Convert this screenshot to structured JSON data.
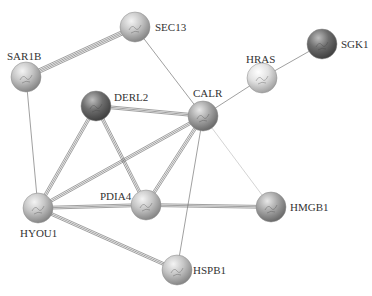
{
  "diagram": {
    "type": "protein-interaction-network",
    "node_radius": 15,
    "nodes": [
      {
        "id": "SEC13",
        "label": "SEC13",
        "x": 135,
        "y": 27,
        "shade": "light",
        "label_x": 155,
        "label_y": 31,
        "label_anchor": "start"
      },
      {
        "id": "SAR1B",
        "label": "SAR1B",
        "x": 26,
        "y": 77,
        "shade": "light",
        "label_x": 7,
        "label_y": 60,
        "label_anchor": "start"
      },
      {
        "id": "DERL2",
        "label": "DERL2",
        "x": 96,
        "y": 106,
        "shade": "dark",
        "label_x": 114,
        "label_y": 101,
        "label_anchor": "start"
      },
      {
        "id": "CALR",
        "label": "CALR",
        "x": 203,
        "y": 116,
        "shade": "mid",
        "label_x": 193,
        "label_y": 97,
        "label_anchor": "start"
      },
      {
        "id": "HRAS",
        "label": "HRAS",
        "x": 262,
        "y": 78,
        "shade": "lighter",
        "label_x": 246,
        "label_y": 63,
        "label_anchor": "start"
      },
      {
        "id": "SGK1",
        "label": "SGK1",
        "x": 322,
        "y": 44,
        "shade": "dark",
        "label_x": 341,
        "label_y": 48,
        "label_anchor": "start"
      },
      {
        "id": "PDIA4",
        "label": "PDIA4",
        "x": 146,
        "y": 205,
        "shade": "light",
        "label_x": 100,
        "label_y": 200,
        "label_anchor": "start"
      },
      {
        "id": "HMGB1",
        "label": "HMGB1",
        "x": 271,
        "y": 207,
        "shade": "mid",
        "label_x": 290,
        "label_y": 211,
        "label_anchor": "start"
      },
      {
        "id": "HYOU1",
        "label": "HYOU1",
        "x": 38,
        "y": 208,
        "shade": "light",
        "label_x": 20,
        "label_y": 237,
        "label_anchor": "start"
      },
      {
        "id": "HSPB1",
        "label": "HSPB1",
        "x": 177,
        "y": 270,
        "shade": "light",
        "label_x": 193,
        "label_y": 274,
        "label_anchor": "start"
      }
    ],
    "edges": [
      {
        "source": "SAR1B",
        "target": "SEC13",
        "strength": "strong"
      },
      {
        "source": "SEC13",
        "target": "CALR",
        "strength": "weak"
      },
      {
        "source": "SAR1B",
        "target": "HYOU1",
        "strength": "weak"
      },
      {
        "source": "DERL2",
        "target": "CALR",
        "strength": "medium"
      },
      {
        "source": "DERL2",
        "target": "HYOU1",
        "strength": "medium"
      },
      {
        "source": "DERL2",
        "target": "PDIA4",
        "strength": "medium"
      },
      {
        "source": "CALR",
        "target": "HRAS",
        "strength": "weak"
      },
      {
        "source": "HRAS",
        "target": "SGK1",
        "strength": "weak"
      },
      {
        "source": "CALR",
        "target": "HYOU1",
        "strength": "medium"
      },
      {
        "source": "CALR",
        "target": "PDIA4",
        "strength": "medium"
      },
      {
        "source": "CALR",
        "target": "HSPB1",
        "strength": "weak"
      },
      {
        "source": "CALR",
        "target": "HMGB1",
        "strength": "faint"
      },
      {
        "source": "HYOU1",
        "target": "PDIA4",
        "strength": "medium"
      },
      {
        "source": "HYOU1",
        "target": "HSPB1",
        "strength": "medium"
      },
      {
        "source": "PDIA4",
        "target": "HMGB1",
        "strength": "medium"
      }
    ],
    "colors": {
      "background": "#ffffff",
      "edge": "#777777",
      "edge_faint": "#cfcfcf",
      "label": "#333333"
    }
  }
}
